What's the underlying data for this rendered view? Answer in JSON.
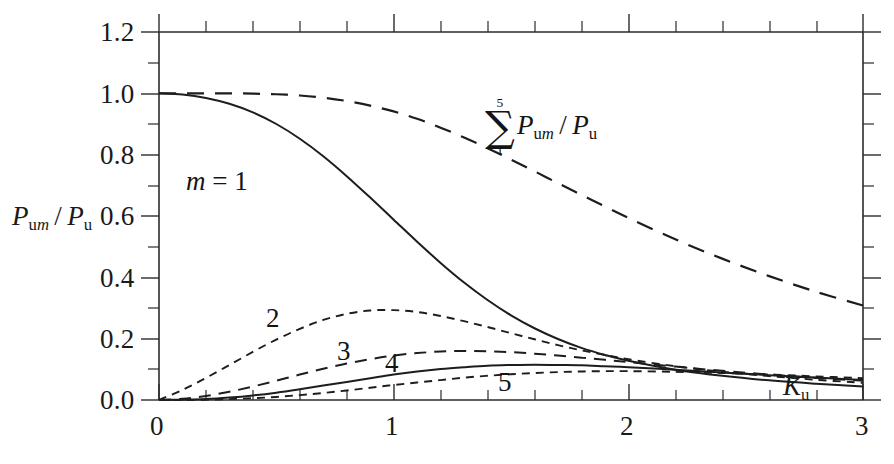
{
  "figure": {
    "background": "#ffffff",
    "ink_color": "#1a1a1a"
  },
  "axes": {
    "y_title_html": "P<sub>um</sub> / P<sub>u</sub>",
    "y_title_plain": "P_um / P_u",
    "x_title_html": "K<sub>u</sub>",
    "x_title_plain": "K_u",
    "x_ticks": [
      "0",
      "1",
      "2",
      "3"
    ],
    "y_ticks": [
      "0.0",
      "0.2",
      "0.4",
      "0.6",
      "0.8",
      "1.0",
      "1.2"
    ]
  },
  "annotations": {
    "m_equals_one": "m = 1",
    "curve_2": "2",
    "curve_3": "3",
    "curve_4": "4",
    "curve_5": "5",
    "sum_upper": "5",
    "sum_lower": "1",
    "sum_sigma": "∑",
    "sum_body_html": "P<sub>um</sub> / P<sub>u</sub>",
    "sum_body_plain": "P_um / P_u"
  },
  "chart_data": {
    "type": "line",
    "title": "",
    "xlabel": "K_u",
    "ylabel": "P_um / P_u",
    "xlim": [
      0,
      3
    ],
    "ylim": [
      0,
      1.2
    ],
    "x_major_ticks": [
      0,
      1,
      2,
      3
    ],
    "x_minor_step": 0.2,
    "y_major_ticks": [
      0.0,
      0.2,
      0.4,
      0.6,
      0.8,
      1.0,
      1.2
    ],
    "y_minor_step": 0.1,
    "grid": false,
    "legend_position": "inline-curve-labels",
    "x": [
      0,
      0.1,
      0.2,
      0.3,
      0.4,
      0.5,
      0.6,
      0.7,
      0.8,
      0.9,
      1.0,
      1.1,
      1.2,
      1.3,
      1.4,
      1.5,
      1.6,
      1.7,
      1.8,
      1.9,
      2.0,
      2.2,
      2.4,
      2.6,
      2.8,
      3.0
    ],
    "series": [
      {
        "name": "m = 1",
        "style": "solid",
        "label": "m = 1",
        "values": [
          1.0,
          0.996,
          0.985,
          0.966,
          0.938,
          0.9,
          0.852,
          0.795,
          0.73,
          0.66,
          0.588,
          0.516,
          0.447,
          0.383,
          0.326,
          0.276,
          0.234,
          0.199,
          0.17,
          0.147,
          0.128,
          0.099,
          0.079,
          0.064,
          0.053,
          0.044
        ]
      },
      {
        "name": "m = 2",
        "style": "dashed-short",
        "label": "2",
        "values": [
          0.0,
          0.033,
          0.072,
          0.114,
          0.157,
          0.197,
          0.232,
          0.261,
          0.281,
          0.292,
          0.293,
          0.287,
          0.274,
          0.257,
          0.238,
          0.218,
          0.198,
          0.179,
          0.162,
          0.147,
          0.133,
          0.11,
          0.092,
          0.078,
          0.066,
          0.056
        ]
      },
      {
        "name": "m = 3",
        "style": "dashed-medium",
        "label": "3",
        "values": [
          0.0,
          0.004,
          0.013,
          0.027,
          0.044,
          0.063,
          0.083,
          0.102,
          0.119,
          0.133,
          0.145,
          0.153,
          0.158,
          0.16,
          0.159,
          0.156,
          0.151,
          0.145,
          0.138,
          0.131,
          0.124,
          0.109,
          0.095,
          0.083,
          0.072,
          0.063
        ]
      },
      {
        "name": "m = 4",
        "style": "solid",
        "label": "4",
        "values": [
          0.0,
          0.001,
          0.003,
          0.008,
          0.015,
          0.024,
          0.035,
          0.047,
          0.059,
          0.071,
          0.083,
          0.093,
          0.101,
          0.107,
          0.112,
          0.114,
          0.115,
          0.114,
          0.113,
          0.11,
          0.107,
          0.099,
          0.09,
          0.081,
          0.073,
          0.065
        ]
      },
      {
        "name": "m = 5",
        "style": "dashed-short",
        "label": "5",
        "values": [
          0.0,
          0.0,
          0.001,
          0.003,
          0.006,
          0.01,
          0.016,
          0.023,
          0.031,
          0.04,
          0.049,
          0.057,
          0.065,
          0.073,
          0.079,
          0.084,
          0.088,
          0.091,
          0.093,
          0.094,
          0.094,
          0.092,
          0.088,
          0.083,
          0.077,
          0.071
        ]
      },
      {
        "name": "Sum 1..5 P_um / P_u",
        "style": "dashed-long",
        "label": "∑ 1..5 P_um / P_u",
        "values": [
          1.0,
          1.0,
          1.0,
          1.0,
          0.999,
          0.997,
          0.993,
          0.986,
          0.975,
          0.96,
          0.941,
          0.917,
          0.888,
          0.856,
          0.821,
          0.784,
          0.746,
          0.707,
          0.669,
          0.631,
          0.594,
          0.524,
          0.461,
          0.404,
          0.353,
          0.308
        ]
      }
    ]
  }
}
